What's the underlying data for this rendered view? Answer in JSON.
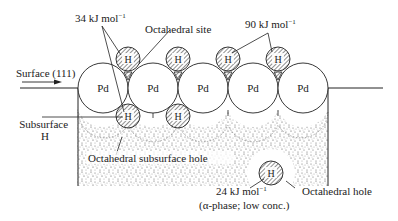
{
  "labels": {
    "energy_top_left": "34 kJ mol",
    "energy_top_left_sup": "−1",
    "octahedral_site": "Octahedral site",
    "energy_top_right": "90 kJ mol",
    "energy_top_right_sup": "−1",
    "surface": "Surface (111)",
    "subsurface_line1": "Subsurface",
    "subsurface_line2": "H",
    "octahedral_subsurface_hole": "Octahedral subsurface hole",
    "energy_bulk": "24 kJ mol",
    "energy_bulk_sup": "−1",
    "bulk_phase_note": "(α-phase; low conc.)",
    "octahedral_hole": "Octahedral hole"
  },
  "atoms": {
    "pd_label": "Pd",
    "h_label": "H",
    "pd": [
      {
        "cx": 103,
        "cy": 88
      },
      {
        "cx": 153,
        "cy": 88
      },
      {
        "cx": 203,
        "cy": 88
      },
      {
        "cx": 253,
        "cy": 88
      },
      {
        "cx": 303,
        "cy": 88
      }
    ],
    "h_surface": [
      {
        "cx": 128,
        "cy": 59
      },
      {
        "cx": 178,
        "cy": 59
      },
      {
        "cx": 228,
        "cy": 59
      },
      {
        "cx": 278,
        "cy": 59
      }
    ],
    "h_subsurface": [
      {
        "cx": 128,
        "cy": 116
      },
      {
        "cx": 178,
        "cy": 116
      }
    ],
    "h_bulk": {
      "cx": 271,
      "cy": 173
    }
  },
  "colors": {
    "stroke": "#222222",
    "stipple": "#444444",
    "background": "#ffffff"
  }
}
